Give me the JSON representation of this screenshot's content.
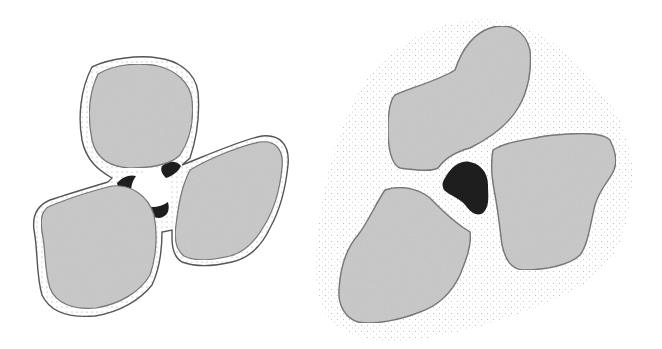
{
  "figure": {
    "width": 662,
    "height": 349,
    "background": "#ffffff",
    "colors": {
      "grain_fill": "#c8c8c8",
      "grain_stroke": "#6e6e6e",
      "film_fill": "#ffffff",
      "film_stroke": "#555555",
      "film_dot": "#9a9a9a",
      "water_dark": "#1e1e1e",
      "air_void": "#ffffff",
      "halo_dot": "#b5b5b5"
    },
    "panels": [
      {
        "id": "left",
        "description": "Three grains each coated with a thin dotted film; dark water wedges at contacts around a central white air void",
        "film_outlines": [
          "M92,67 C110,58 140,55 158,58 C175,60 195,70 198,92 C200,115 196,140 190,158 L182,165 C196,160 240,140 262,136 C280,134 290,145 288,165 C286,185 280,210 270,228 C262,245 250,258 232,262 C215,266 198,268 182,262 C175,258 172,248 172,238 L172,230 L162,232 C162,250 160,268 152,285 C140,300 120,312 95,316 C70,318 50,312 42,295 C36,275 38,250 34,230 C32,215 38,205 50,200 C65,195 88,188 108,182 L112,178 C98,170 86,160 82,140 C78,118 80,90 92,67 Z"
        ],
        "grains": [
          "M98,74 C115,64 140,62 158,66 C175,70 190,82 192,100 C194,120 190,140 180,155 C170,165 150,168 130,168 C110,167 96,158 92,140 C88,120 88,95 98,74 Z",
          "M190,170 C210,158 240,146 260,142 C276,140 284,150 282,168 C280,188 274,210 264,226 C256,240 246,252 230,256 C212,260 196,262 184,256 C176,250 174,238 176,225 C178,210 180,190 190,170 Z",
          "M50,206 C70,198 95,190 112,186 C130,184 148,195 154,215 C158,235 156,258 150,275 C140,292 120,304 96,308 C74,310 56,304 50,288 C44,270 46,250 42,232 C40,218 42,210 50,206 Z"
        ],
        "water_wedges": [
          "M117,183 C122,177 130,174 136,176 C132,182 130,188 132,195 C126,196 118,192 117,183 Z",
          "M162,166 C168,161 176,160 181,166 C178,172 172,176 166,178 C162,174 160,170 162,166 Z",
          "M142,205 C150,208 160,208 168,202 C170,210 168,216 160,218 C152,218 144,213 142,205 Z"
        ],
        "air_void": "M136,176 C146,170 158,168 166,172 C170,180 170,192 168,202 C160,208 150,208 142,205 C134,200 130,192 132,185 C133,180 134,178 136,176 Z"
      },
      {
        "id": "right",
        "description": "Three grains immersed in a stippled (fine particle) halo; single dark water body at the central pore",
        "halo_outline": "M350,110 C370,60 420,25 470,20 C520,15 560,40 590,80 C620,110 640,150 630,200 C625,245 610,270 575,290 C535,310 490,325 445,335 C400,345 355,345 330,320 C310,295 315,250 320,215 C325,175 335,140 350,110 Z",
        "grains": [
          "M395,95 C410,88 440,80 455,70 C460,55 470,35 490,28 C510,22 525,30 530,50 C532,70 528,92 518,108 C508,125 490,138 470,148 C455,152 445,158 438,168 C430,172 415,170 400,168 C392,165 388,150 388,130 C388,112 390,100 395,95 Z",
          "M493,150 C505,142 525,140 545,136 C565,134 600,130 610,140 C615,150 618,160 614,170 C610,180 600,188 595,205 C590,225 588,245 580,255 C570,265 545,270 525,270 C510,270 505,258 502,245 C500,230 498,210 495,195 C492,180 490,165 493,150 Z",
          "M385,190 C400,185 418,188 430,198 C440,208 450,220 470,232 C472,245 466,260 460,275 C452,292 440,305 420,312 C400,320 375,325 358,322 C345,318 338,305 339,290 C340,270 345,250 358,235 C368,222 375,205 385,190 Z"
        ],
        "water_body": "M445,178 C452,165 462,160 470,162 C480,164 488,172 488,185 C488,195 490,205 484,212 C478,218 470,212 466,206 C460,198 450,196 444,190 C442,186 442,182 445,178 Z"
      }
    ]
  }
}
